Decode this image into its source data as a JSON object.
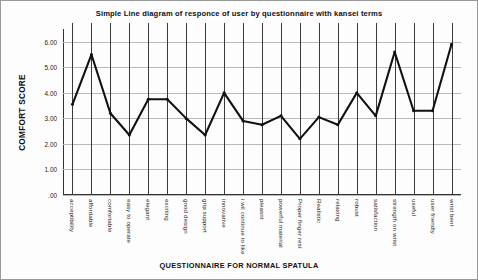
{
  "chart_data": {
    "type": "line",
    "title": "Simple Line diagram of responce of user by questionnaire with kansei terms",
    "xlabel": "QUESTIONNAIRE FOR NORMAL SPATULA",
    "ylabel": "COMFORT SCORE",
    "ylim": [
      0,
      6.5
    ],
    "yticks": [
      0,
      1,
      2,
      3,
      4,
      5,
      6
    ],
    "ytick_labels": [
      ".00",
      "1.00",
      "2.00",
      "3.00",
      "4.00",
      "5.00",
      "6.00"
    ],
    "grid": "both",
    "legend": "none",
    "line_color": "#111111",
    "categories": [
      "acceptibility",
      "affordable",
      "comfortable",
      "easy to operate",
      "elegant",
      "exciting",
      "good design",
      "grip support",
      "innovative",
      "i wil continue to like",
      "pleasnt",
      "powerful material",
      "Proper finger rest",
      "Realistic",
      "relaxing",
      "robust",
      "satisfaction",
      "strength on wrist",
      "useful",
      "user friendly",
      "wrist bent"
    ],
    "values": [
      3.55,
      5.5,
      3.2,
      2.35,
      3.75,
      3.75,
      3.0,
      2.35,
      4.0,
      2.9,
      2.75,
      3.1,
      2.2,
      3.05,
      2.75,
      4.0,
      3.1,
      5.6,
      3.3,
      3.3,
      5.9
    ]
  }
}
